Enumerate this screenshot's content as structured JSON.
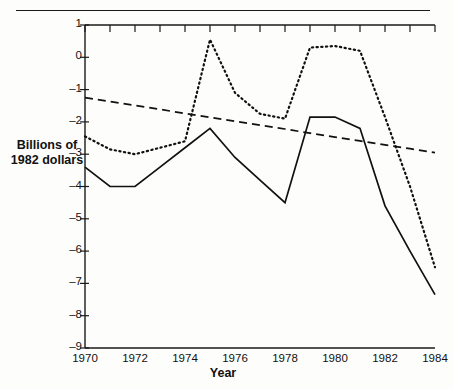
{
  "axes": {
    "ylabel_line1": "Billions of",
    "ylabel_line2": "1982 dollars",
    "xlabel": "Year",
    "ytick_labels": [
      "1",
      "0",
      "–1",
      "–2",
      "–3",
      "–4",
      "–5",
      "–6",
      "–7",
      "–8",
      "–9"
    ],
    "xtick_labels": [
      "1970",
      "1972",
      "1974",
      "1976",
      "1978",
      "1980",
      "1982",
      "1984"
    ]
  },
  "chart_data": {
    "type": "line",
    "title": "",
    "xlabel": "Year",
    "ylabel": "Billions of 1982 dollars",
    "xlim": [
      1970,
      1984
    ],
    "ylim": [
      -9,
      1
    ],
    "grid": false,
    "legend": "none",
    "yticks": [
      1,
      0,
      -1,
      -2,
      -3,
      -4,
      -5,
      -6,
      -7,
      -8,
      -9
    ],
    "xticks": [
      1970,
      1972,
      1974,
      1976,
      1978,
      1980,
      1982,
      1984
    ],
    "x": [
      1970,
      1971,
      1972,
      1973,
      1974,
      1975,
      1976,
      1977,
      1978,
      1979,
      1980,
      1981,
      1982,
      1983,
      1984
    ],
    "series": [
      {
        "name": "solid-series",
        "style": "solid",
        "color": "#111111",
        "values": [
          -3.4,
          -4.0,
          -4.0,
          -3.4,
          -2.8,
          -2.2,
          -3.1,
          -3.8,
          -4.5,
          -1.85,
          -1.85,
          -2.2,
          -4.6,
          -6.0,
          -7.35
        ]
      },
      {
        "name": "dotted-series",
        "style": "dotted",
        "color": "#111111",
        "values": [
          -2.45,
          -2.85,
          -3.0,
          -2.8,
          -2.6,
          0.55,
          -1.1,
          -1.75,
          -1.9,
          0.3,
          0.35,
          0.2,
          -1.85,
          -4.0,
          -6.5
        ]
      },
      {
        "name": "dashed-trend",
        "style": "dashed",
        "color": "#111111",
        "values": [
          -1.25,
          -1.37,
          -1.49,
          -1.61,
          -1.74,
          -1.86,
          -1.98,
          -2.1,
          -2.22,
          -2.35,
          -2.47,
          -2.59,
          -2.71,
          -2.83,
          -2.95
        ]
      }
    ]
  }
}
